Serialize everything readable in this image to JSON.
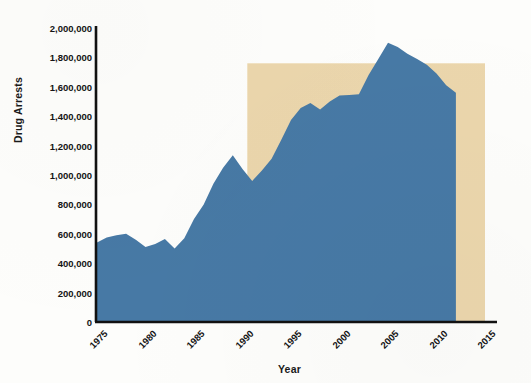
{
  "chart_data": {
    "type": "area",
    "title": "",
    "xlabel": "Year",
    "ylabel": "Drug Arrests",
    "xlim": [
      1975,
      2015
    ],
    "ylim": [
      0,
      2000000
    ],
    "grid": false,
    "legend": "none",
    "series": [
      {
        "name": "Drug Arrests",
        "color": "#4779A5",
        "x": [
          1975,
          1976,
          1977,
          1978,
          1979,
          1980,
          1981,
          1982,
          1983,
          1984,
          1985,
          1986,
          1987,
          1988,
          1989,
          1990,
          1991,
          1992,
          1993,
          1994,
          1995,
          1996,
          1997,
          1998,
          1999,
          2000,
          2001,
          2002,
          2003,
          2004,
          2005,
          2006,
          2007,
          2008,
          2009,
          2010,
          2011,
          2012
        ],
        "values": [
          540000,
          575000,
          590000,
          600000,
          560000,
          510000,
          530000,
          565000,
          500000,
          570000,
          700000,
          800000,
          940000,
          1050000,
          1135000,
          1040000,
          960000,
          1030000,
          1110000,
          1240000,
          1375000,
          1455000,
          1490000,
          1445000,
          1500000,
          1540000,
          1545000,
          1550000,
          1680000,
          1790000,
          1900000,
          1870000,
          1825000,
          1790000,
          1750000,
          1690000,
          1610000,
          1560000
        ]
      }
    ],
    "yticks": [
      "0",
      "200,000",
      "400,000",
      "600,000",
      "800,000",
      "1,000,000",
      "1,200,000",
      "1,400,000",
      "1,600,000",
      "1,800,000",
      "2,000,000"
    ],
    "ytick_values": [
      0,
      200000,
      400000,
      600000,
      800000,
      1000000,
      1200000,
      1400000,
      1600000,
      1800000,
      2000000
    ],
    "xticks": [
      "1975",
      "1980",
      "1985",
      "1990",
      "1995",
      "2000",
      "2005",
      "2010",
      "2015"
    ],
    "xtick_values": [
      1975,
      1980,
      1985,
      1990,
      1995,
      2000,
      2005,
      2010,
      2015
    ],
    "annotations": [
      {
        "name": "highlight-band",
        "type": "rect",
        "x_start": 1990.5,
        "x_end": 2015,
        "y_start": 0,
        "y_end": 1760000,
        "color": "#EBD6AC"
      }
    ],
    "colors": {
      "area": "#4779A5",
      "highlight": "#EBD6AC",
      "axis": "#111111",
      "text": "#141414",
      "background": "#FDFDFB"
    }
  }
}
